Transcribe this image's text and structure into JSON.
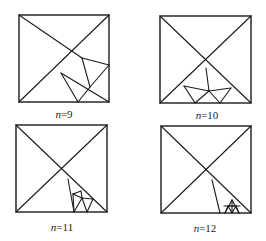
{
  "figure": {
    "panels": [
      {
        "id": "n9",
        "label_var": "n",
        "label_rest": "=9",
        "label_pos": [
          64,
          108
        ],
        "square": [
          19,
          15,
          109,
          102
        ],
        "segments": [
          [
            19,
            15,
            82,
            58
          ],
          [
            19,
            102,
            109,
            15
          ],
          [
            82,
            58,
            109,
            65
          ],
          [
            82,
            58,
            90,
            87
          ],
          [
            61,
            73,
            78,
            102
          ],
          [
            61,
            73,
            109,
            102
          ],
          [
            90,
            87,
            109,
            65
          ],
          [
            90,
            87,
            78,
            102
          ]
        ]
      },
      {
        "id": "n10",
        "label_var": "n",
        "label_rest": "=10",
        "label_pos": [
          207,
          109
        ],
        "square": [
          160,
          16,
          251,
          103
        ],
        "segments": [
          [
            160,
            16,
            251,
            103
          ],
          [
            160,
            103,
            251,
            16
          ],
          [
            206,
            68,
            209,
            91
          ],
          [
            184,
            86,
            209,
            91
          ],
          [
            209,
            91,
            231,
            88
          ],
          [
            184,
            86,
            195,
            103
          ],
          [
            195,
            103,
            209,
            91
          ],
          [
            209,
            91,
            220,
            103
          ],
          [
            220,
            103,
            231,
            88
          ]
        ]
      },
      {
        "id": "n11",
        "label_var": "n",
        "label_rest": "=11",
        "label_pos": [
          62,
          221
        ],
        "square": [
          16,
          125,
          107,
          212
        ],
        "segments": [
          [
            16,
            125,
            107,
            212
          ],
          [
            16,
            212,
            107,
            125
          ],
          [
            68,
            179,
            74,
            212
          ],
          [
            73,
            194,
            81,
            191
          ],
          [
            73,
            194,
            82,
            198
          ],
          [
            81,
            191,
            82,
            198
          ],
          [
            82,
            198,
            93,
            199
          ],
          [
            82,
            198,
            74,
            212
          ],
          [
            82,
            198,
            87,
            212
          ],
          [
            93,
            199,
            87,
            212
          ],
          [
            73,
            194,
            74,
            212
          ]
        ]
      },
      {
        "id": "n12",
        "label_var": "n",
        "label_rest": "=12",
        "label_pos": [
          205,
          222
        ],
        "square": [
          161,
          126,
          251,
          213
        ],
        "segments": [
          [
            161,
            126,
            251,
            213
          ],
          [
            161,
            213,
            251,
            126
          ],
          [
            212,
            180,
            220,
            213
          ],
          [
            225,
            213,
            232,
            200
          ],
          [
            232,
            200,
            239,
            213
          ],
          [
            228,
            206,
            236,
            206
          ],
          [
            228,
            206,
            232,
            213
          ],
          [
            236,
            206,
            232,
            213
          ],
          [
            232,
            200,
            232,
            213
          ],
          [
            228,
            206,
            225,
            213
          ],
          [
            236,
            206,
            239,
            213
          ],
          [
            224,
            206,
            240,
            206
          ]
        ]
      }
    ],
    "stroke_color": "#1a1a1a",
    "background": "#ffffff"
  }
}
